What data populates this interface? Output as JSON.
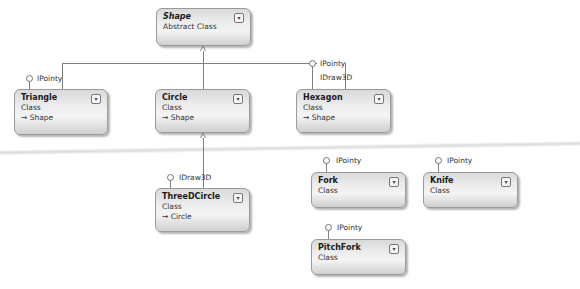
{
  "diagram": {
    "type": "class-diagram",
    "classes": [
      {
        "id": "shape",
        "name": "Shape",
        "kind": "Abstract Class",
        "base": null,
        "abstract": true
      },
      {
        "id": "triangle",
        "name": "Triangle",
        "kind": "Class",
        "base": "→ Shape"
      },
      {
        "id": "circle",
        "name": "Circle",
        "kind": "Class",
        "base": "→ Shape"
      },
      {
        "id": "hexagon",
        "name": "Hexagon",
        "kind": "Class",
        "base": "→ Shape"
      },
      {
        "id": "threedcircle",
        "name": "ThreeDCircle",
        "kind": "Class",
        "base": "→ Circle"
      },
      {
        "id": "fork",
        "name": "Fork",
        "kind": "Class",
        "base": null
      },
      {
        "id": "knife",
        "name": "Knife",
        "kind": "Class",
        "base": null
      },
      {
        "id": "pitchfork",
        "name": "PitchFork",
        "kind": "Class",
        "base": null
      }
    ],
    "interfaces": {
      "triangle": [
        "IPointy"
      ],
      "hexagon": [
        "IPointy",
        "IDraw3D"
      ],
      "threedcircle": [
        "IDraw3D"
      ],
      "fork": [
        "IPointy"
      ],
      "knife": [
        "IPointy"
      ],
      "pitchfork": [
        "IPointy"
      ]
    },
    "inheritance": [
      {
        "child": "Triangle",
        "parent": "Shape"
      },
      {
        "child": "Circle",
        "parent": "Shape"
      },
      {
        "child": "Hexagon",
        "parent": "Shape"
      },
      {
        "child": "ThreeDCircle",
        "parent": "Circle"
      }
    ],
    "expand_icon": "chevron-double-down-icon"
  }
}
